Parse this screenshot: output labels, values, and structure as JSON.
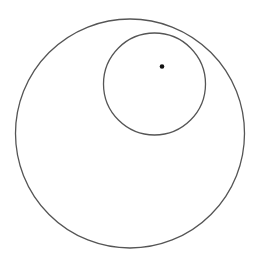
{
  "diagram": {
    "width": 259,
    "height": 269,
    "background": "#ffffff",
    "stroke_color": "#555555",
    "dot_color": "#111111",
    "outer_circle": {
      "cx": 130,
      "cy": 133.5,
      "r": 114.5
    },
    "inner_circle": {
      "cx": 154.5,
      "cy": 84,
      "r": 51
    },
    "point": {
      "cx": 162,
      "cy": 66.5,
      "r": 2.3
    }
  }
}
